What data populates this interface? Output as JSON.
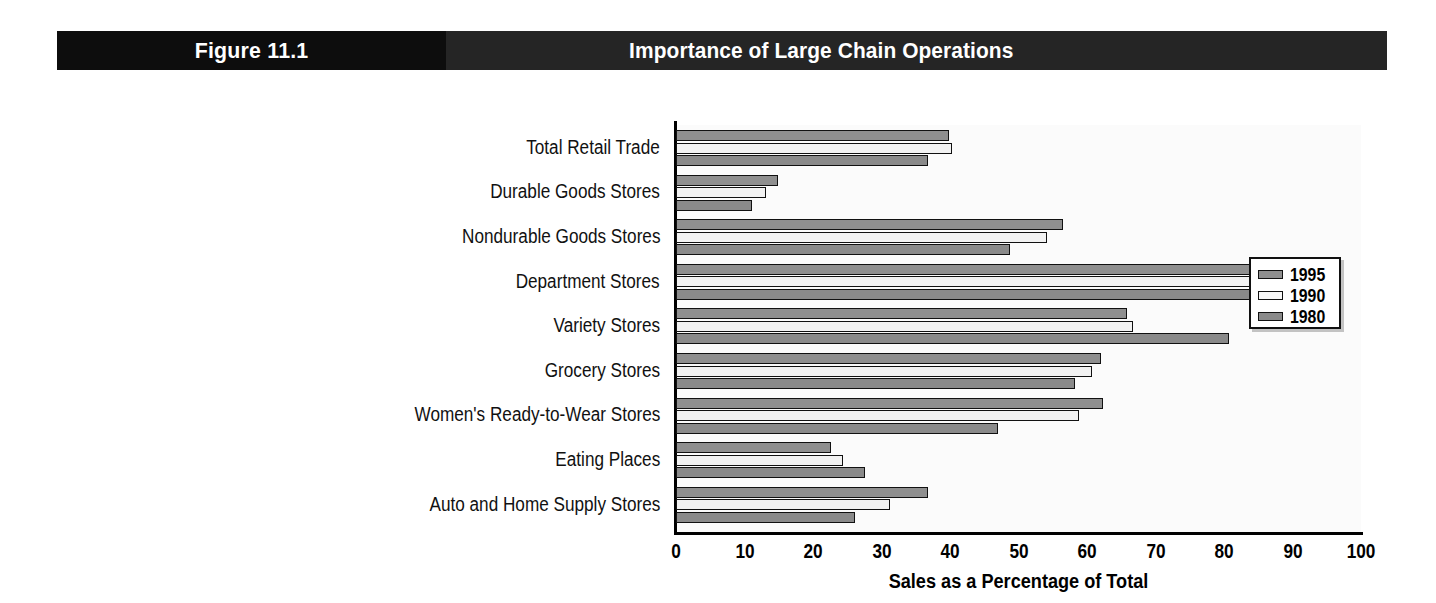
{
  "header": {
    "figure_number": "Figure 11.1",
    "title": "Importance of Large Chain Operations",
    "left_bg": "#0d0d0d",
    "right_bg": "#252525",
    "text_color": "#ffffff"
  },
  "legend": {
    "position": "top-right-inside",
    "entries": [
      {
        "label": "1995",
        "color": "#8f8f8f"
      },
      {
        "label": "1990",
        "color": "#f7f7f7"
      },
      {
        "label": "1980",
        "color": "#8a8a8a"
      }
    ]
  },
  "chart_data": {
    "type": "bar",
    "orientation": "horizontal",
    "title": "Importance of Large Chain Operations",
    "subtitle": "Figure 11.1",
    "xlabel": "Sales as a Percentage of Total",
    "ylabel": "",
    "xlim": [
      0,
      100
    ],
    "xticks": [
      0,
      10,
      20,
      30,
      40,
      50,
      60,
      70,
      80,
      90,
      100
    ],
    "grid": false,
    "legend_position": "upper right",
    "categories": [
      "Total Retail Trade",
      "Durable Goods Stores",
      "Nondurable Goods Stores",
      "Department Stores",
      "Variety Stores",
      "Grocery Stores",
      "Women's Ready-to-Wear Stores",
      "Eating Places",
      "Auto and Home Supply Stores"
    ],
    "series": [
      {
        "name": "1995",
        "color": "#8f8f8f",
        "values": [
          39.9,
          14.9,
          56.5,
          94.8,
          65.9,
          62.0,
          62.3,
          22.6,
          36.8
        ]
      },
      {
        "name": "1990",
        "color": "#f7f7f7",
        "values": [
          40.3,
          13.1,
          54.2,
          92.9,
          66.7,
          60.8,
          58.8,
          24.4,
          31.2
        ]
      },
      {
        "name": "1980",
        "color": "#8a8a8a",
        "values": [
          36.8,
          11.1,
          48.7,
          90.7,
          80.7,
          58.3,
          47.0,
          27.6,
          26.2
        ]
      }
    ]
  }
}
